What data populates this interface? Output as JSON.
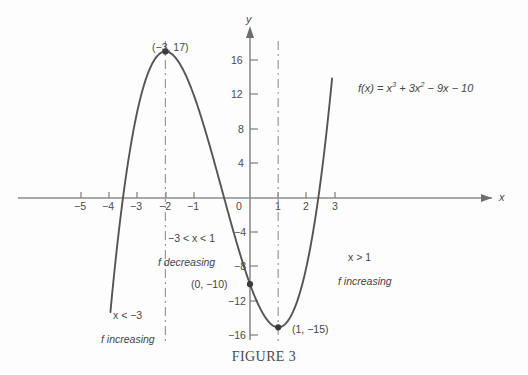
{
  "figure": {
    "caption": "FIGURE 3",
    "function_label_parts": {
      "lead": "f(x) = x",
      "exp1": "3",
      "mid": " + 3x",
      "exp2": "2",
      "tail": " − 9x − 10"
    },
    "function_label_plain": "f(x) = x³ + 3x² − 9x − 10"
  },
  "axes": {
    "x_axis_name": "x",
    "y_axis_name": "y",
    "x_ticks": [
      "−5",
      "−4",
      "−3",
      "−2",
      "−1",
      "0",
      "1",
      "2",
      "3"
    ],
    "y_ticks": [
      "16",
      "12",
      "8",
      "4",
      "−4",
      "−8",
      "−12",
      "−16"
    ]
  },
  "points": {
    "max_label": "(−3, 17)",
    "intercept_label": "(0, −10)",
    "min_label": "(1, −15)"
  },
  "annotations": {
    "left_condition": "x < −3",
    "left_behavior": "f increasing",
    "middle_condition": "−3 < x < 1",
    "middle_behavior": "f decreasing",
    "right_condition": "x > 1",
    "right_behavior": "f increasing"
  },
  "colors": {
    "curve": "#555555",
    "axis": "#8c8c8c",
    "dashed": "#9a9a9a",
    "text": "#454545",
    "background": "#fdfdfd"
  },
  "chart_data": {
    "type": "line",
    "title": "FIGURE 3",
    "xlabel": "x",
    "ylabel": "y",
    "xlim": [
      -5.6,
      3.2
    ],
    "ylim": [
      -18.5,
      19.5
    ],
    "grid": false,
    "legend": "none",
    "function": "f(x) = x^3 + 3x^2 - 9x - 10",
    "coefficients": {
      "x3": 1,
      "x2": 3,
      "x1": -9,
      "x0": -10
    },
    "x_tick_values": [
      -5,
      -4,
      -3,
      -2,
      -1,
      0,
      1,
      2,
      3
    ],
    "y_tick_values": [
      16,
      12,
      8,
      4,
      -4,
      -8,
      -12,
      -16
    ],
    "series": [
      {
        "name": "f(x) = x^3 + 3x^2 - 9x - 10",
        "x": [
          -5.4,
          -5.2,
          -5.0,
          -4.8,
          -4.6,
          -4.4,
          -4.2,
          -4.0,
          -3.8,
          -3.6,
          -3.4,
          -3.2,
          -3.0,
          -2.8,
          -2.6,
          -2.4,
          -2.2,
          -2.0,
          -1.8,
          -1.6,
          -1.4,
          -1.2,
          -1.0,
          -0.8,
          -0.6,
          -0.4,
          -0.2,
          0.0,
          0.2,
          0.4,
          0.6,
          0.8,
          1.0,
          1.2,
          1.4,
          1.6,
          1.8,
          2.0,
          2.2,
          2.4,
          2.6,
          2.8,
          2.9
        ],
        "y": [
          -31.5,
          -22.5,
          -15.0,
          -8.4,
          -2.8,
          2.0,
          6.0,
          10.0,
          12.8,
          15.1,
          16.7,
          17.6,
          17.0,
          17.0,
          16.3,
          15.1,
          13.5,
          12.0,
          9.9,
          7.8,
          4.7,
          2.3,
          0.0,
          -1.4,
          -3.7,
          -5.8,
          -7.9,
          -10.0,
          -11.7,
          -13.1,
          -14.1,
          -14.8,
          -15.0,
          -14.8,
          -13.8,
          -12.6,
          -8.8,
          -8.0,
          -3.6,
          0.5,
          4.9,
          8.4,
          12.4
        ]
      }
    ],
    "marked_points": [
      {
        "x": -3,
        "y": 17,
        "label": "(-3, 17)",
        "kind": "local maximum"
      },
      {
        "x": 0,
        "y": -10,
        "label": "(0, -10)",
        "kind": "y-intercept"
      },
      {
        "x": 1,
        "y": -15,
        "label": "(1, -15)",
        "kind": "local minimum"
      }
    ],
    "vertical_dashed_lines": [
      -3,
      1
    ],
    "annotations": [
      {
        "text": "x < -3 / f increasing",
        "region": "x < -3"
      },
      {
        "text": "-3 < x < 1 / f decreasing",
        "region": "-3 < x < 1"
      },
      {
        "text": "x > 1 / f increasing",
        "region": "x > 1"
      }
    ]
  }
}
